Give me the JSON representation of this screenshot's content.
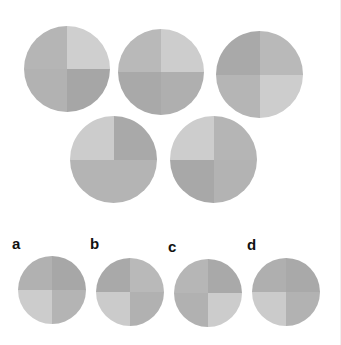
{
  "palette": {
    "light": "#d0d0d0",
    "medium": "#b6b6b6",
    "dark": "#a6a6a6"
  },
  "puzzle": {
    "figures": [
      {
        "id": "fig-1",
        "x": 24,
        "y": 26,
        "size": 86,
        "tl": "#b5b5b5",
        "tr": "#cfcfcf",
        "bl": "#b2b2b2",
        "br": "#a6a6a6"
      },
      {
        "id": "fig-2",
        "x": 118,
        "y": 29,
        "size": 86,
        "tl": "#b9b9b9",
        "tr": "#cdcdcd",
        "bl": "#a9a9a9",
        "br": "#afafaf"
      },
      {
        "id": "fig-3",
        "x": 216,
        "y": 31,
        "size": 87,
        "tl": "#a9a9a9",
        "tr": "#b9b9b9",
        "bl": "#b5b5b5",
        "br": "#cdcdcd"
      },
      {
        "id": "fig-4",
        "x": 70,
        "y": 116,
        "size": 87,
        "tl": "#cccccc",
        "tr": "#a9a9a9",
        "bl": "#b4b4b4",
        "br": "#b4b4b4"
      },
      {
        "id": "fig-5",
        "x": 170,
        "y": 116,
        "size": 87,
        "tl": "#cdcdcd",
        "tr": "#b5b5b5",
        "bl": "#a8a8a8",
        "br": "#b3b3b3"
      }
    ],
    "options": [
      {
        "label": "a",
        "label_x": 12,
        "label_y": 236,
        "x": 18,
        "y": 256,
        "size": 68,
        "tl": "#b1b1b1",
        "tr": "#a7a7a7",
        "bl": "#cccccc",
        "br": "#b4b4b4"
      },
      {
        "label": "b",
        "label_x": 90,
        "label_y": 236,
        "x": 96,
        "y": 258,
        "size": 68,
        "tl": "#a9a9a9",
        "tr": "#b9b9b9",
        "bl": "#cbcbcb",
        "br": "#b1b1b1"
      },
      {
        "label": "c",
        "label_x": 168,
        "label_y": 239,
        "x": 174,
        "y": 259,
        "size": 68,
        "tl": "#b6b6b6",
        "tr": "#a9a9a9",
        "bl": "#b1b1b1",
        "br": "#cccccc"
      },
      {
        "label": "d",
        "label_x": 247,
        "label_y": 237,
        "x": 252,
        "y": 258,
        "size": 68,
        "tl": "#afafaf",
        "tr": "#a9a9a9",
        "bl": "#cbcbcb",
        "br": "#b2b2b2"
      }
    ]
  }
}
